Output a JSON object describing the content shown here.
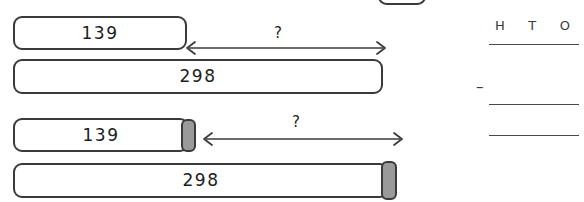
{
  "worksheet": {
    "title": "Bar model subtraction",
    "stroke_color": "#3a3a3a",
    "tab_color": "#9a9a9a",
    "background": "#ffffff"
  },
  "models": [
    {
      "id": "model-top",
      "part_bar": {
        "label": "139"
      },
      "whole_bar": {
        "label": "298"
      },
      "arrow": {
        "label": "?",
        "style": "double-headed"
      },
      "has_tabs": false
    },
    {
      "id": "model-bottom",
      "part_bar": {
        "label": "139"
      },
      "whole_bar": {
        "label": "298"
      },
      "arrow": {
        "label": "?",
        "style": "double-headed"
      },
      "has_tabs": true
    }
  ],
  "column_work": {
    "headers": [
      "H",
      "T",
      "O"
    ],
    "operator": "–",
    "answer_lines": 2
  }
}
